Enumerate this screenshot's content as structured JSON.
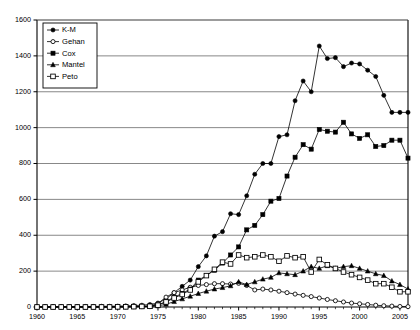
{
  "chart_data": {
    "type": "line",
    "title": "",
    "subtitle": "",
    "xlabel": "",
    "ylabel": "",
    "xlim": [
      1960,
      2006
    ],
    "ylim": [
      0,
      1600
    ],
    "ytick_step": 200,
    "xtick_step": 1,
    "xlabel_step": 5,
    "grid": "horizontal",
    "legend_position": "top-left",
    "ytick_labels": [
      "0",
      "200",
      "400",
      "600",
      "800",
      "1000",
      "1200",
      "1400",
      "1600"
    ],
    "xtick_labels": [
      "1960",
      "1965",
      "1970",
      "1975",
      "1980",
      "1985",
      "1990",
      "1995",
      "2000",
      "2005"
    ],
    "x": [
      1960,
      1961,
      1962,
      1963,
      1964,
      1965,
      1966,
      1967,
      1968,
      1969,
      1970,
      1971,
      1972,
      1973,
      1974,
      1975,
      1976,
      1977,
      1978,
      1979,
      1980,
      1981,
      1982,
      1983,
      1984,
      1985,
      1986,
      1987,
      1988,
      1989,
      1990,
      1991,
      1992,
      1993,
      1994,
      1995,
      1996,
      1997,
      1998,
      1999,
      2000,
      2001,
      2002,
      2003,
      2004,
      2005,
      2006
    ],
    "series": [
      {
        "name": "K-M",
        "marker": "filled-circle",
        "color": "#000000",
        "values": [
          2,
          2,
          2,
          2,
          2,
          2,
          3,
          3,
          4,
          4,
          5,
          6,
          8,
          10,
          14,
          22,
          45,
          80,
          115,
          150,
          225,
          285,
          395,
          420,
          520,
          515,
          620,
          740,
          800,
          800,
          950,
          960,
          1150,
          1260,
          1200,
          1455,
          1385,
          1390,
          1340,
          1360,
          1355,
          1320,
          1285,
          1180,
          1085,
          1085,
          1085
        ]
      },
      {
        "name": "Gehan",
        "marker": "open-circle",
        "color": "#000000",
        "values": [
          0,
          0,
          0,
          0,
          0,
          0,
          0,
          1,
          1,
          1,
          2,
          2,
          3,
          4,
          5,
          20,
          55,
          80,
          95,
          110,
          120,
          125,
          130,
          130,
          128,
          132,
          120,
          95,
          100,
          95,
          88,
          80,
          72,
          65,
          58,
          50,
          42,
          35,
          28,
          22,
          18,
          14,
          10,
          7,
          5,
          3,
          2
        ]
      },
      {
        "name": "Cox",
        "marker": "filled-square",
        "color": "#000000",
        "values": [
          0,
          0,
          0,
          0,
          0,
          0,
          0,
          0,
          0,
          0,
          1,
          1,
          2,
          3,
          5,
          12,
          30,
          55,
          75,
          100,
          150,
          175,
          205,
          245,
          290,
          335,
          430,
          455,
          515,
          590,
          605,
          730,
          835,
          905,
          880,
          990,
          980,
          975,
          1030,
          965,
          940,
          960,
          895,
          900,
          930,
          930,
          830
        ]
      },
      {
        "name": "Mantel",
        "marker": "filled-triangle",
        "color": "#000000",
        "values": [
          0,
          0,
          0,
          0,
          0,
          0,
          0,
          0,
          0,
          0,
          0,
          1,
          1,
          2,
          3,
          6,
          15,
          30,
          45,
          60,
          75,
          88,
          100,
          108,
          118,
          140,
          125,
          140,
          155,
          165,
          190,
          185,
          180,
          200,
          225,
          215,
          230,
          215,
          225,
          230,
          215,
          200,
          185,
          175,
          145,
          125,
          100
        ]
      },
      {
        "name": "Peto",
        "marker": "open-square",
        "color": "#000000",
        "values": [
          0,
          0,
          0,
          0,
          0,
          0,
          0,
          0,
          0,
          0,
          1,
          1,
          2,
          3,
          4,
          10,
          28,
          50,
          70,
          95,
          140,
          175,
          210,
          250,
          240,
          290,
          275,
          280,
          290,
          280,
          255,
          285,
          275,
          280,
          195,
          265,
          235,
          215,
          195,
          180,
          165,
          150,
          130,
          130,
          110,
          85,
          85
        ]
      }
    ]
  },
  "legend": {
    "items": [
      {
        "label": "K-M",
        "marker": "filled-circle"
      },
      {
        "label": "Gehan",
        "marker": "open-circle"
      },
      {
        "label": "Cox",
        "marker": "filled-square"
      },
      {
        "label": "Mantel",
        "marker": "filled-triangle"
      },
      {
        "label": "Peto",
        "marker": "open-square"
      }
    ]
  },
  "colors": {
    "axis": "#000000",
    "grid": "#555555",
    "plot_background": "#ffffff",
    "series": "#000000"
  }
}
